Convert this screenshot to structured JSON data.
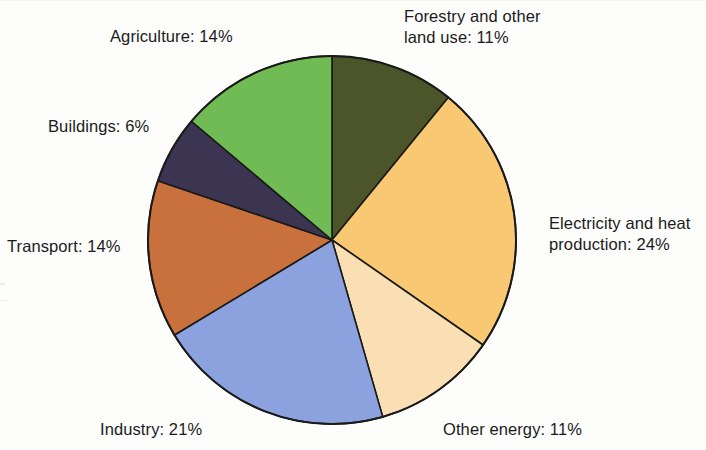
{
  "chart_data": {
    "type": "pie",
    "title": "",
    "subtitle": "",
    "xlabel": "",
    "ylabel": "",
    "legend_position": "none",
    "grid": false,
    "units": "%",
    "start_angle_deg": 0,
    "direction": "clockwise",
    "total": 101,
    "categories": [
      "Forestry and other land use",
      "Electricity and heat production",
      "Other energy",
      "Industry",
      "Transport",
      "Buildings",
      "Agriculture"
    ],
    "values": [
      11,
      24,
      11,
      21,
      14,
      6,
      14
    ],
    "colors": [
      "#4c5529",
      "#f8c873",
      "#fadfb4",
      "#8ba2de",
      "#c8713d",
      "#3c3551",
      "#71bb54"
    ],
    "slices": [
      {
        "name": "Forestry and other land use",
        "value": 11,
        "label": "Forestry and other\nland use: 11%",
        "color": "#4c5529",
        "start_deg": 0,
        "end_deg": 39.2
      },
      {
        "name": "Electricity and heat production",
        "value": 24,
        "label": "Electricity and heat\nproduction: 24%",
        "color": "#f8c873",
        "start_deg": 39.2,
        "end_deg": 124.8
      },
      {
        "name": "Other energy",
        "value": 11,
        "label": "Other energy: 11%",
        "color": "#fadfb4",
        "start_deg": 124.8,
        "end_deg": 164.0
      },
      {
        "name": "Industry",
        "value": 21,
        "label": "Industry: 21%",
        "color": "#8ba2de",
        "start_deg": 164.0,
        "end_deg": 238.9
      },
      {
        "name": "Transport",
        "value": 14,
        "label": "Transport: 14%",
        "color": "#c8713d",
        "start_deg": 238.9,
        "end_deg": 288.8
      },
      {
        "name": "Buildings",
        "value": 6,
        "label": "Buildings: 6%",
        "color": "#3c3551",
        "start_deg": 288.8,
        "end_deg": 310.2
      },
      {
        "name": "Agriculture",
        "value": 14,
        "label": "Agriculture: 14%",
        "color": "#71bb54",
        "start_deg": 310.2,
        "end_deg": 360.0
      }
    ],
    "geometry": {
      "center_x": 332,
      "center_y": 240,
      "radius": 184,
      "outline_color": "#1a1a1a",
      "outline_width": 1.6,
      "background": "#fdfdfb"
    }
  },
  "labels": {
    "forestry": "Forestry and other\nland use: 11%",
    "electricity": "Electricity and heat\nproduction: 24%",
    "other_energy": "Other energy: 11%",
    "industry": "Industry: 21%",
    "transport": "Transport: 14%",
    "buildings": "Buildings: 6%",
    "agriculture": "Agriculture: 14%"
  }
}
